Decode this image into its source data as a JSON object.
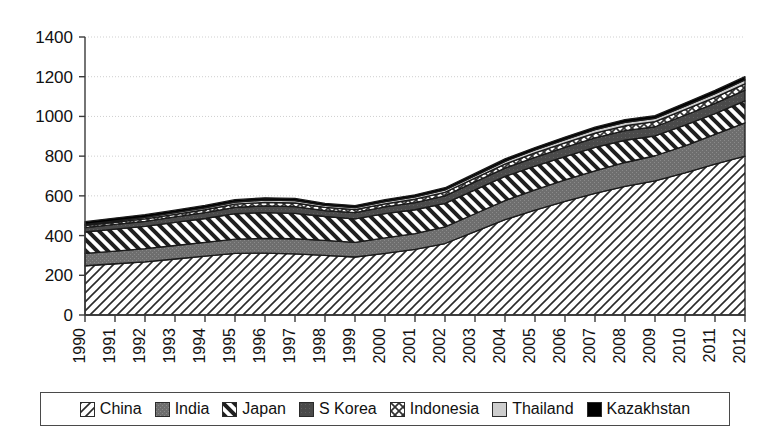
{
  "chart_data": {
    "type": "area",
    "stacked": true,
    "title": "",
    "subtitle": "",
    "xlabel": "",
    "ylabel": "",
    "xlim": [
      1990,
      2012
    ],
    "ylim": [
      0,
      1400
    ],
    "ytick_step": 200,
    "ytick_labels": [
      "0",
      "200",
      "400",
      "600",
      "800",
      "1000",
      "1200",
      "1400"
    ],
    "ytick_values": [
      0,
      200,
      400,
      600,
      800,
      1000,
      1200,
      1400
    ],
    "grid": true,
    "grid_axis": "y",
    "legend_position": "bottom",
    "categories": [
      "1990",
      "1991",
      "1992",
      "1993",
      "1994",
      "1995",
      "1996",
      "1997",
      "1998",
      "1999",
      "2000",
      "2001",
      "2002",
      "2003",
      "2004",
      "2005",
      "2006",
      "2007",
      "2008",
      "2009",
      "2010",
      "2011",
      "2012"
    ],
    "x": [
      1990,
      1991,
      1992,
      1993,
      1994,
      1995,
      1996,
      1997,
      1998,
      1999,
      2000,
      2001,
      2002,
      2003,
      2004,
      2005,
      2006,
      2007,
      2008,
      2009,
      2010,
      2011,
      2012
    ],
    "series": [
      {
        "name": "China",
        "pattern": "diagonal-hatch-up",
        "color": "#ffffff",
        "values": [
          248,
          258,
          268,
          282,
          296,
          310,
          312,
          308,
          300,
          292,
          310,
          330,
          360,
          420,
          480,
          528,
          572,
          612,
          648,
          676,
          716,
          760,
          800
        ]
      },
      {
        "name": "India",
        "pattern": "gray-medium",
        "color": "#686868",
        "values": [
          62,
          64,
          66,
          68,
          70,
          72,
          74,
          76,
          76,
          74,
          78,
          80,
          84,
          90,
          96,
          102,
          108,
          114,
          120,
          126,
          136,
          150,
          168
        ]
      },
      {
        "name": "Japan",
        "pattern": "diagonal-hatch-down",
        "color": "#ffffff",
        "values": [
          108,
          110,
          112,
          116,
          120,
          128,
          130,
          128,
          120,
          118,
          122,
          120,
          118,
          120,
          122,
          120,
          118,
          118,
          112,
          100,
          104,
          104,
          110
        ]
      },
      {
        "name": "S Korea",
        "pattern": "gray-dark",
        "color": "#4a4a4a",
        "values": [
          22,
          24,
          26,
          28,
          30,
          32,
          34,
          34,
          30,
          32,
          34,
          36,
          38,
          40,
          42,
          44,
          46,
          48,
          48,
          46,
          50,
          52,
          54
        ]
      },
      {
        "name": "Indonesia",
        "pattern": "crosshatch",
        "color": "#ffffff",
        "values": [
          10,
          11,
          12,
          13,
          14,
          16,
          17,
          18,
          16,
          15,
          16,
          17,
          18,
          19,
          20,
          22,
          23,
          24,
          25,
          26,
          28,
          30,
          32
        ]
      },
      {
        "name": "Thailand",
        "pattern": "gray-light",
        "color": "#c8c8c8",
        "values": [
          6,
          7,
          8,
          9,
          10,
          11,
          12,
          12,
          10,
          10,
          11,
          12,
          12,
          13,
          14,
          15,
          16,
          17,
          17,
          16,
          18,
          19,
          20
        ]
      },
      {
        "name": "Kazakhstan",
        "pattern": "solid-black",
        "color": "#000000",
        "values": [
          14,
          14,
          13,
          12,
          12,
          12,
          11,
          11,
          10,
          10,
          10,
          10,
          11,
          11,
          12,
          12,
          13,
          13,
          14,
          14,
          15,
          16,
          16
        ]
      }
    ],
    "totals": [
      470,
      488,
      505,
      528,
      552,
      581,
      590,
      587,
      562,
      551,
      581,
      605,
      641,
      713,
      786,
      843,
      896,
      946,
      984,
      1004,
      1067,
      1131,
      1200
    ]
  },
  "legend": {
    "items": [
      {
        "label": "China",
        "pattern": "diagonal-hatch-up"
      },
      {
        "label": "India",
        "pattern": "gray-medium"
      },
      {
        "label": "Japan",
        "pattern": "diagonal-hatch-down"
      },
      {
        "label": "S Korea",
        "pattern": "gray-dark"
      },
      {
        "label": "Indonesia",
        "pattern": "crosshatch"
      },
      {
        "label": "Thailand",
        "pattern": "gray-light"
      },
      {
        "label": "Kazakhstan",
        "pattern": "solid-black"
      }
    ]
  },
  "colors": {
    "axis": "#3a3a3a",
    "grid": "#cfcfcf",
    "outline": "#1a1a1a",
    "background": "#ffffff"
  }
}
